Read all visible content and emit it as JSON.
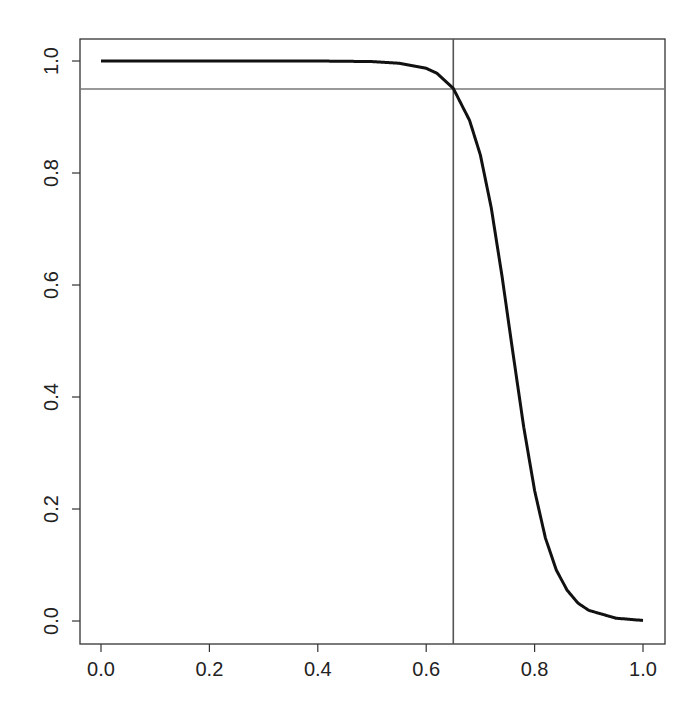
{
  "chart_data": {
    "type": "line",
    "title": "",
    "xlabel": "",
    "ylabel": "",
    "xlim": [
      0.0,
      1.0
    ],
    "ylim": [
      0.0,
      1.0
    ],
    "grid": false,
    "legend": null,
    "x_ticks": [
      "0.0",
      "0.2",
      "0.4",
      "0.6",
      "0.8",
      "1.0"
    ],
    "y_ticks": [
      "0.0",
      "0.2",
      "0.4",
      "0.6",
      "0.8",
      "1.0"
    ],
    "series": [
      {
        "name": "curve",
        "color": "#111111",
        "x": [
          0.0,
          0.1,
          0.2,
          0.3,
          0.4,
          0.5,
          0.55,
          0.6,
          0.62,
          0.65,
          0.68,
          0.7,
          0.72,
          0.74,
          0.76,
          0.78,
          0.8,
          0.82,
          0.84,
          0.86,
          0.88,
          0.9,
          0.95,
          1.0
        ],
        "y": [
          1.0,
          1.0,
          1.0,
          1.0,
          1.0,
          0.999,
          0.996,
          0.987,
          0.978,
          0.951,
          0.894,
          0.832,
          0.738,
          0.615,
          0.479,
          0.346,
          0.233,
          0.148,
          0.091,
          0.055,
          0.032,
          0.019,
          0.005,
          0.001
        ]
      }
    ],
    "reference_lines": [
      {
        "orientation": "horizontal",
        "value": 0.95,
        "color": "#777777"
      },
      {
        "orientation": "vertical",
        "value": 0.65,
        "color": "#555555"
      }
    ]
  }
}
